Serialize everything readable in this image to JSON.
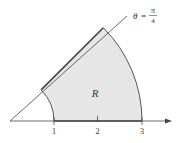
{
  "diagram": {
    "region_label": "R",
    "ray_label": {
      "theta": "θ",
      "equals": "=",
      "numerator": "π",
      "denominator": "4"
    },
    "ticks": [
      "1",
      "2",
      "3"
    ],
    "colors": {
      "fill": "#e6e6e6",
      "stroke": "#555555",
      "axis": "#444444"
    }
  }
}
